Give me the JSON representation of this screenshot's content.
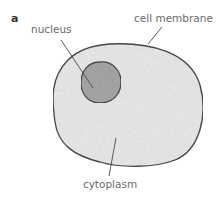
{
  "figure": {
    "panel_label": "a",
    "labels": {
      "nucleus": "nucleus",
      "cell_membrane": "cell membrane",
      "cytoplasm": "cytoplasm"
    },
    "colors": {
      "cytoplasm_fill": "#ececec",
      "nucleus_fill": "#a9a9a9",
      "outline": "#4a4a4a",
      "label_text": "#6b6b6b",
      "leader_line": "#4a4a4a"
    }
  }
}
